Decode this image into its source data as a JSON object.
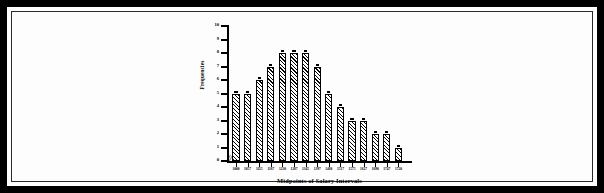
{
  "figure": {
    "border_color": "#000000",
    "background": "#ffffff"
  },
  "chart_data": {
    "type": "bar",
    "title": "",
    "subtitle": "",
    "xlabel": "Midpoints of Salary Intervals",
    "ylabel": "Frequencies",
    "categories": [
      "1000",
      "1057",
      "1115",
      "1167",
      "1230",
      "1287",
      "1345",
      "1397",
      "1460",
      "1517",
      "1575",
      "1627",
      "1690",
      "1747",
      "1720"
    ],
    "values": [
      5,
      5,
      6,
      7,
      8,
      8,
      8,
      7,
      5,
      4,
      3,
      3,
      2,
      2,
      1
    ],
    "ylim": [
      0,
      10
    ],
    "ytick_labels": [
      "10",
      "9",
      "8",
      "7",
      "6",
      "5",
      "4",
      "3",
      "2",
      "1",
      "0"
    ],
    "ytick_values": [
      10,
      9,
      8,
      7,
      6,
      5,
      4,
      3,
      2,
      1,
      0
    ],
    "grid": false,
    "legend": null,
    "axis_break_symbol": "//",
    "bar_fill": "diagonal-hatch",
    "bar_edge_color": "#000000",
    "annotations": []
  }
}
